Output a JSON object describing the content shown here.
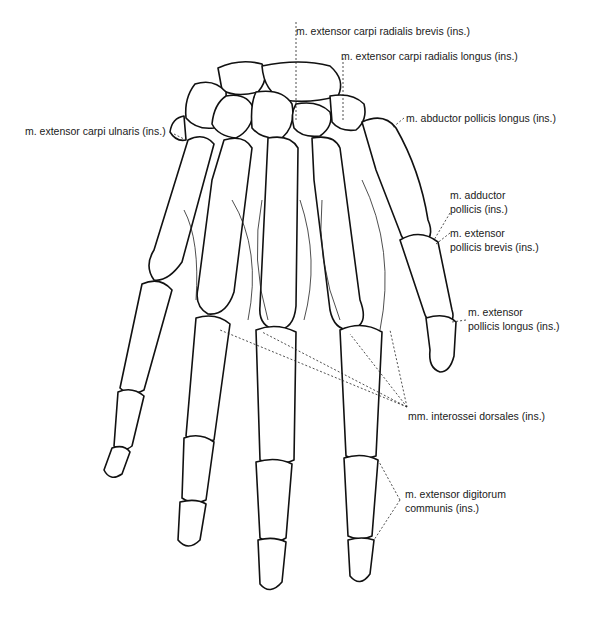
{
  "figure": {
    "labels": {
      "ecrb": "m. extensor carpi radialis brevis (ins.)",
      "ecrl": "m. extensor carpi radialis longus (ins.)",
      "apl": "m. abductor pollicis longus (ins.)",
      "ecu": "m. extensor carpi ulnaris (ins.)",
      "add_poll_1": "m. adductor",
      "add_poll_2": "pollicis (ins.)",
      "epb_1": "m. extensor",
      "epb_2": "pollicis brevis (ins.)",
      "epl_1": "m. extensor",
      "epl_2": "pollicis longus (ins.)",
      "interossei": "mm. interossei dorsales (ins.)",
      "edc_1": "m. extensor digitorum",
      "edc_2": "communis (ins.)"
    },
    "caption_partial": ""
  }
}
